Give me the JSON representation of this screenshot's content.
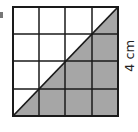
{
  "diagram": {
    "grid_rows": 4,
    "grid_cols": 4,
    "shaded_region": "lower-right triangle below diagonal",
    "shade_color": "#a6a6a6",
    "line_color": "#1a1a1a",
    "side_label": "4 cm"
  }
}
